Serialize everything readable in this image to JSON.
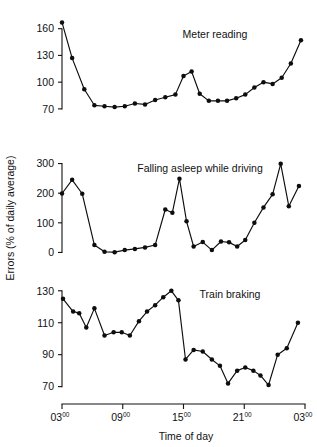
{
  "figure": {
    "axis_titles": {
      "y": "Errors (% of daily average)",
      "x": "Time of day"
    },
    "x_tick_labels": [
      {
        "main": "03",
        "sup": "00"
      },
      {
        "main": "09",
        "sup": "00"
      },
      {
        "main": "15",
        "sup": "00"
      },
      {
        "main": "21",
        "sup": "00"
      },
      {
        "main": "03",
        "sup": "00"
      }
    ],
    "x_tick_hours": [
      3,
      9,
      15,
      21,
      27
    ]
  },
  "chart_data": [
    {
      "type": "line",
      "title": "Meter reading",
      "xlabel": "Time of day",
      "ylabel": "Errors (% of daily average)",
      "xlim": [
        3,
        27
      ],
      "ylim": [
        62,
        172
      ],
      "yticks": [
        70,
        100,
        130,
        160
      ],
      "ytick_labels": [
        "70",
        "100",
        "130",
        "160"
      ],
      "xticks": [
        3,
        9,
        15,
        21,
        27
      ],
      "xtick_labels": [
        "03:00",
        "09:00",
        "15:00",
        "21:00",
        "03:00"
      ],
      "grid": false,
      "legend": "none",
      "markers": true,
      "x": [
        3.0,
        4.0,
        5.2,
        6.2,
        7.2,
        8.2,
        9.2,
        10.2,
        11.2,
        12.2,
        13.2,
        14.2,
        15.0,
        15.8,
        16.6,
        17.5,
        18.4,
        19.3,
        20.2,
        21.1,
        22.0,
        22.9,
        23.8,
        24.7,
        25.6,
        26.6
      ],
      "y": [
        167,
        127,
        92,
        74,
        73,
        72,
        73,
        76,
        75,
        80,
        83,
        86,
        107,
        112,
        87,
        79,
        79,
        79,
        82,
        86,
        94,
        100,
        98,
        105,
        121,
        147
      ]
    },
    {
      "type": "line",
      "title": "Falling asleep while driving",
      "xlabel": "Time of day",
      "ylabel": "Errors (% of daily average)",
      "xlim": [
        3,
        27
      ],
      "ylim": [
        -12,
        312
      ],
      "yticks": [
        0,
        100,
        200,
        300
      ],
      "ytick_labels": [
        "0",
        "100",
        "200",
        "300"
      ],
      "xticks": [
        3,
        9,
        15,
        21,
        27
      ],
      "xtick_labels": [
        "03:00",
        "09:00",
        "15:00",
        "21:00",
        "03:00"
      ],
      "grid": false,
      "legend": "none",
      "markers": true,
      "x": [
        3.0,
        4.0,
        5.0,
        6.2,
        7.2,
        8.2,
        9.2,
        10.2,
        11.2,
        12.2,
        13.2,
        13.9,
        14.6,
        15.3,
        16.0,
        16.9,
        17.8,
        18.7,
        19.5,
        20.3,
        21.1,
        22.0,
        22.9,
        23.8,
        24.6,
        25.4,
        26.4
      ],
      "y": [
        199,
        245,
        198,
        25,
        2,
        1,
        8,
        12,
        17,
        25,
        145,
        134,
        249,
        105,
        20,
        35,
        8,
        37,
        34,
        20,
        42,
        100,
        152,
        196,
        299,
        156,
        224
      ]
    },
    {
      "type": "line",
      "title": "Train braking",
      "xlabel": "Time of day",
      "ylabel": "Errors (% of daily average)",
      "xlim": [
        3,
        27
      ],
      "ylim": [
        66,
        133
      ],
      "yticks": [
        70,
        90,
        110,
        130
      ],
      "ytick_labels": [
        "70",
        "90",
        "110",
        "130"
      ],
      "xticks": [
        3,
        9,
        15,
        21,
        27
      ],
      "xtick_labels": [
        "03:00",
        "09:00",
        "15:00",
        "21:00",
        "03:00"
      ],
      "grid": false,
      "legend": "none",
      "markers": true,
      "x": [
        3.1,
        4.1,
        4.7,
        5.4,
        6.2,
        7.2,
        8.1,
        8.9,
        9.7,
        10.6,
        11.4,
        12.2,
        13.0,
        13.8,
        14.5,
        15.2,
        16.0,
        16.9,
        17.8,
        18.6,
        19.4,
        20.3,
        21.1,
        21.9,
        22.6,
        23.4,
        24.3,
        25.2,
        26.3
      ],
      "y": [
        125,
        117,
        116,
        107,
        119,
        102,
        104,
        104,
        102,
        111,
        117,
        121,
        126,
        130,
        124,
        87,
        93,
        92,
        87,
        83,
        72,
        80,
        82,
        80,
        77,
        71,
        90,
        94,
        110
      ]
    }
  ]
}
